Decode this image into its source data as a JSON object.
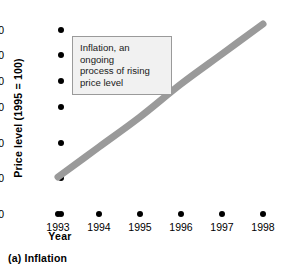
{
  "chart_data": {
    "type": "line",
    "title": "",
    "caption": "(a) Inflation",
    "xlabel": "Year",
    "ylabel": "Price level (1995 = 100)",
    "x": [
      1993,
      1994,
      1995,
      1996,
      1997,
      1998
    ],
    "categories": [
      "1993",
      "1994",
      "1995",
      "1996",
      "1997",
      "1998"
    ],
    "values": [
      100,
      110,
      120,
      131,
      141,
      151
    ],
    "series": [
      {
        "name": "Price level",
        "values": [
          100,
          110,
          120,
          131,
          141,
          151
        ],
        "color": "#9a9a9a"
      }
    ],
    "ylim": [
      90,
      150
    ],
    "yticks": [
      90,
      100,
      110,
      120,
      130,
      140,
      150
    ],
    "ytick_labels": [
      "90",
      "100",
      "110",
      "120",
      "130",
      "140",
      "150"
    ],
    "xtick_labels": [
      "1993",
      "1994",
      "1995",
      "1996",
      "1997",
      "1998"
    ],
    "grid": false,
    "legend": "none",
    "marker": "dot",
    "annotations": [
      {
        "text": "Inflation, an ongoing process of rising price level",
        "lines": [
          "Inflation, an ongoing",
          "process of rising",
          "price level"
        ],
        "box_fill": "#f1f1f1",
        "box_border": "#9a9a9a"
      }
    ]
  },
  "axis": {
    "y_title": "Price level (1995 = 100)",
    "x_title": "Year",
    "y_labels": [
      "150",
      "140",
      "130",
      "120",
      "110",
      "100",
      "90"
    ],
    "x_labels": [
      "1993",
      "1994",
      "1995",
      "1996",
      "1997",
      "1998"
    ]
  },
  "callout": {
    "line1": "Inflation, an ongoing",
    "line2": "process of rising",
    "line3": "price level"
  },
  "figure": {
    "caption": "(a) Inflation"
  },
  "colors": {
    "curve": "#9a9a9a",
    "marker": "#000000",
    "callout_fill": "#f1f1f1",
    "callout_border": "#9a9a9a"
  }
}
